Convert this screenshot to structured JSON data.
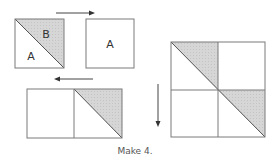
{
  "diagram": {
    "step1_square": {
      "label_lower": "A",
      "label_upper": "B"
    },
    "step1_plain_square": {
      "label": "A"
    },
    "caption": "Make 4.",
    "colors": {
      "shade": "#d3d3d3",
      "line": "#7a7a7a"
    }
  }
}
